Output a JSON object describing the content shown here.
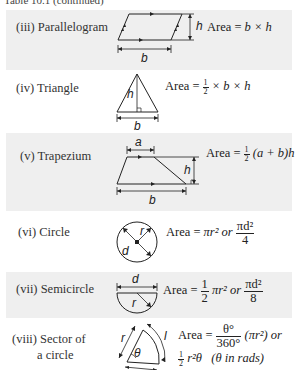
{
  "header": {
    "title": "Table 10.1  (continued)"
  },
  "rows": [
    {
      "label": "(iii) Parallelogram",
      "formula_prefix": "Area =",
      "formula": "b × h",
      "dims": {
        "h": "h",
        "b": "b"
      }
    },
    {
      "label": "(iv) Triangle",
      "formula_prefix": "Area =",
      "frac": {
        "n": "1",
        "d": "2"
      },
      "formula": "× b × h",
      "dims": {
        "h": "h",
        "b": "b"
      }
    },
    {
      "label": "(v) Trapezium",
      "formula_prefix": "Area =",
      "frac": {
        "n": "1",
        "d": "2"
      },
      "formula": "(a + b)h",
      "dims": {
        "a": "a",
        "h": "h",
        "b": "b"
      }
    },
    {
      "label": "(vi) Circle",
      "formula_prefix": "Area =",
      "formula": "πr² or",
      "frac": {
        "n": "πd²",
        "d": "4"
      },
      "dims": {
        "r": "r",
        "d": "d"
      }
    },
    {
      "label": "(vii) Semicircle",
      "formula_prefix": "Area =",
      "frac1": {
        "n": "1",
        "d": "2"
      },
      "formula": "πr² or",
      "frac2": {
        "n": "πd²",
        "d": "8"
      },
      "dims": {
        "d": "d",
        "r": "r"
      }
    },
    {
      "label_line1": "(viii) Sector of",
      "label_line2": "a circle",
      "formula_prefix": "Area =",
      "frac": {
        "n": "θ°",
        "d": "360°"
      },
      "formula": "(πr²) or",
      "line2_frac": {
        "n": "1",
        "d": "2"
      },
      "line2": "r²θ   (θ in rads)",
      "dims": {
        "r": "r",
        "l": "l",
        "theta": "θ"
      }
    }
  ],
  "colors": {
    "band": "#efefef",
    "ink": "#222222"
  }
}
